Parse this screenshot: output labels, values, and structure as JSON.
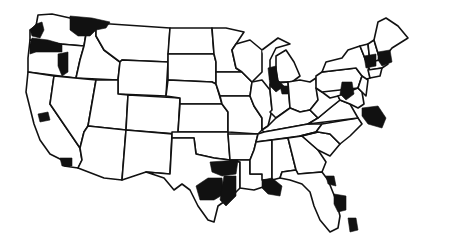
{
  "map": {
    "title": "",
    "subject": "United States state outline map",
    "colors": {
      "background": "#ffffff",
      "state_outline": "#111111",
      "highlighted_region": "#111111"
    },
    "highlighted_regions": [
      {
        "id": "seattle-wa",
        "state": "WA"
      },
      {
        "id": "spokane-wa-id",
        "state": "WA/ID"
      },
      {
        "id": "portland-or",
        "state": "OR/WA"
      },
      {
        "id": "central-or",
        "state": "OR"
      },
      {
        "id": "sf-bay-ca",
        "state": "CA"
      },
      {
        "id": "san-diego-ca",
        "state": "CA"
      },
      {
        "id": "dallas-tx",
        "state": "TX"
      },
      {
        "id": "austin-san-antonio-tx",
        "state": "TX"
      },
      {
        "id": "houston-tx",
        "state": "TX"
      },
      {
        "id": "new-orleans-la",
        "state": "LA"
      },
      {
        "id": "chicago-il",
        "state": "IL"
      },
      {
        "id": "indianapolis-in",
        "state": "IN"
      },
      {
        "id": "pittsburgh-pa",
        "state": "PA"
      },
      {
        "id": "rochester-ny",
        "state": "NY"
      },
      {
        "id": "albany-ny",
        "state": "NY"
      },
      {
        "id": "washington-dc-va",
        "state": "VA/MD"
      },
      {
        "id": "jacksonville-fl",
        "state": "FL"
      },
      {
        "id": "orlando-tampa-fl",
        "state": "FL"
      },
      {
        "id": "miami-fl",
        "state": "FL"
      }
    ]
  }
}
